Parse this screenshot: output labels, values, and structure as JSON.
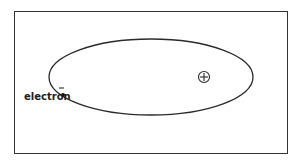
{
  "diagram": {
    "electron_label": "electron",
    "electron_charge": "−",
    "nucleus_symbol": "⊕",
    "colors": {
      "line": "#2a2a2a",
      "background": "#ffffff"
    }
  }
}
